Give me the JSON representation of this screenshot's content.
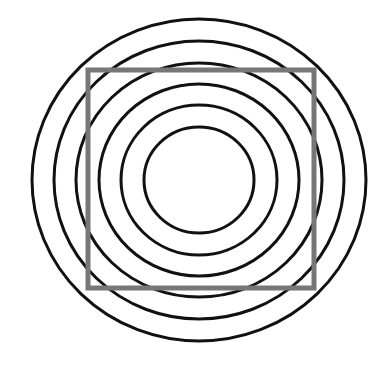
{
  "figure": {
    "background": "#ffffff",
    "circle_color": "#111111",
    "square_color": "#777777",
    "center": [
      199,
      180
    ],
    "circles": [
      {
        "rx": 167,
        "ry": 161
      },
      {
        "rx": 145,
        "ry": 139
      },
      {
        "rx": 123,
        "ry": 117
      },
      {
        "rx": 100,
        "ry": 96
      },
      {
        "rx": 78,
        "ry": 75
      },
      {
        "rx": 55,
        "ry": 53
      }
    ],
    "square": {
      "x": 88,
      "y": 70,
      "width": 226,
      "height": 218
    }
  }
}
